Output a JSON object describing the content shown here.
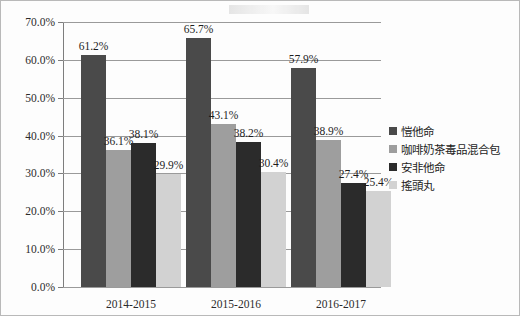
{
  "chart_data": {
    "type": "bar",
    "title": "",
    "subtitle": "",
    "xlabel": "",
    "ylabel": "",
    "categories": [
      "2014-2015",
      "2015-2016",
      "2016-2017"
    ],
    "series": [
      {
        "name": "愷他命",
        "color": "#4a4a4a",
        "values": [
          61.2,
          36.1,
          38.1
        ],
        "labels": [
          "61.2%",
          "36.1%",
          "38.1%"
        ]
      },
      {
        "name": "咖啡奶茶毒品混合包",
        "color": "#9e9e9e",
        "values": [
          65.7,
          43.1,
          38.2
        ],
        "labels": [
          "65.7%",
          "43.1%",
          "38.2%"
        ]
      },
      {
        "name": "安非他命",
        "color": "#2b2b2b",
        "values": [
          57.9,
          38.9,
          27.4
        ],
        "labels": [
          "57.9%",
          "38.9%",
          "27.4%"
        ]
      },
      {
        "name": "搖頭丸",
        "color": "#d2d2d2",
        "values": [
          29.9,
          30.4,
          25.4
        ],
        "labels": [
          "29.9%",
          "30.4%",
          "25.4%"
        ]
      }
    ],
    "groups": [
      {
        "category": "2014-2015",
        "bars": [
          {
            "series": "愷他命",
            "value": 61.2,
            "label": "61.2%",
            "color": "#4a4a4a"
          },
          {
            "series": "咖啡奶茶毒品混合包",
            "value": 36.1,
            "label": "36.1%",
            "color": "#9e9e9e"
          },
          {
            "series": "安非他命",
            "value": 38.1,
            "label": "38.1%",
            "color": "#2b2b2b"
          },
          {
            "series": "搖頭丸",
            "value": 29.9,
            "label": "29.9%",
            "color": "#d2d2d2"
          }
        ]
      },
      {
        "category": "2015-2016",
        "bars": [
          {
            "series": "愷他命",
            "value": 65.7,
            "label": "65.7%",
            "color": "#4a4a4a"
          },
          {
            "series": "咖啡奶茶毒品混合包",
            "value": 43.1,
            "label": "43.1%",
            "color": "#9e9e9e"
          },
          {
            "series": "安非他命",
            "value": 38.2,
            "label": "38.2%",
            "color": "#2b2b2b"
          },
          {
            "series": "搖頭丸",
            "value": 30.4,
            "label": "30.4%",
            "color": "#d2d2d2"
          }
        ]
      },
      {
        "category": "2016-2017",
        "bars": [
          {
            "series": "愷他命",
            "value": 57.9,
            "label": "57.9%",
            "color": "#4a4a4a"
          },
          {
            "series": "咖啡奶茶毒品混合包",
            "value": 38.9,
            "label": "38.9%",
            "color": "#9e9e9e"
          },
          {
            "series": "安非他命",
            "value": 27.4,
            "label": "27.4%",
            "color": "#2b2b2b"
          },
          {
            "series": "搖頭丸",
            "value": 25.4,
            "label": "25.4%",
            "color": "#d2d2d2"
          }
        ]
      }
    ],
    "ylim": [
      0,
      70
    ],
    "ytick_labels": [
      "0.0%",
      "10.0%",
      "20.0%",
      "30.0%",
      "40.0%",
      "50.0%",
      "60.0%",
      "70.0%"
    ],
    "ytick_values": [
      0,
      10,
      20,
      30,
      40,
      50,
      60,
      70
    ],
    "grid": true,
    "legend_position": "right"
  },
  "legend": {
    "items": [
      {
        "label": "愷他命",
        "color": "#4a4a4a"
      },
      {
        "label": "咖啡奶茶毒品混合包",
        "color": "#9e9e9e"
      },
      {
        "label": "安非他命",
        "color": "#2b2b2b"
      },
      {
        "label": "搖頭丸",
        "color": "#d2d2d2"
      }
    ]
  }
}
